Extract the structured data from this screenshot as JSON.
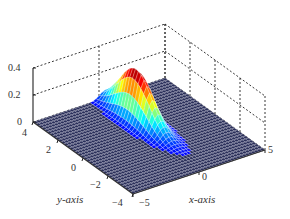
{
  "chart_data": {
    "type": "surface3d",
    "title": "",
    "xlabel": "x-axis",
    "ylabel": "y-axis",
    "zlabel": "",
    "x_ticks": [
      "-5",
      "0",
      "5"
    ],
    "y_ticks": [
      "-4",
      "-2",
      "0",
      "2",
      "4"
    ],
    "z_ticks": [
      "0",
      "0.2",
      "0.4"
    ],
    "xlim": [
      -5,
      5
    ],
    "ylim": [
      -4,
      4
    ],
    "zlim": [
      0,
      0.4
    ],
    "grid": true,
    "box": "dashed back planes",
    "colormap": "jet",
    "surface": {
      "description": "Narrow peak elongated along y-axis, near-flat zero elsewhere",
      "peak_x": 0.5,
      "peak_y": 1.5,
      "peak_z": 0.38,
      "sigma_x": 0.45,
      "sigma_y": 1.3
    },
    "legend": null
  },
  "labels": {
    "x_axis": "x-axis",
    "y_axis": "y-axis",
    "x_tick_neg5": "−5",
    "x_tick_0": "0",
    "x_tick_5": "5",
    "y_tick_4": "4",
    "y_tick_2": "2",
    "y_tick_0": "0",
    "y_tick_neg2": "−2",
    "y_tick_neg4": "−4",
    "z_tick_0": "0",
    "z_tick_02": "0.2",
    "z_tick_04": "0.4"
  }
}
